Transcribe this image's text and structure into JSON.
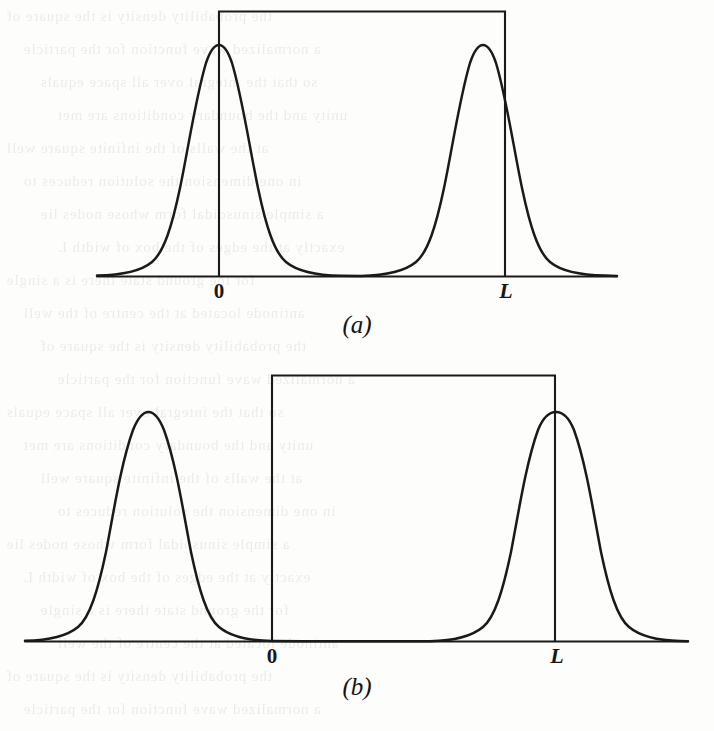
{
  "figure": {
    "background_color": "#fdfdfb",
    "ink_color": "#1a1a1a",
    "panels": [
      {
        "id": "a",
        "caption": "(a)",
        "tick_zero": "0",
        "tick_L": "L"
      },
      {
        "id": "b",
        "caption": "(b)",
        "tick_zero": "0",
        "tick_L": "L"
      }
    ]
  },
  "bleed_text": {
    "lines": [
      "the probability density is the square of",
      "a normalized wave function for the particle",
      "so that the integral over all space equals",
      "unity and the boundary conditions are met",
      "at the walls of the infinite square well",
      "in one dimension the solution reduces to",
      "a simple sinusoidal form whose nodes lie",
      "exactly at the edges of the box of width L",
      "for the ground state there is a single",
      "antinode located at the centre of the well"
    ]
  },
  "chart_data": [
    {
      "type": "line",
      "title": "(a)",
      "xlabel": "",
      "ylabel": "",
      "annotations": [
        "0",
        "L"
      ],
      "grid": false,
      "legend": null,
      "xlim": [
        -1.62,
        2.62
      ],
      "ylim": [
        0,
        1.15
      ],
      "x_tick_values": [
        0,
        1
      ],
      "x_tick_labels": [
        "0",
        "L"
      ],
      "description": "Two identical Gaussian wave packets peaked at x = 0 and x = L, drawn on a horizontal baseline, with a rectangular box (potential well) of height 1.13 spanning from 0 to L. Vertical lines drop from the box top down to the baseline at x = 0 and x = L.",
      "series": [
        {
          "name": "probability-density",
          "kind": "double-gaussian",
          "peak_centers": [
            0,
            1
          ],
          "peak_height": 0.87,
          "peak_sigma": 0.135,
          "baseline": 0
        },
        {
          "name": "potential-well-box",
          "kind": "rectangle-top",
          "x_start": 0,
          "x_end": 1,
          "height": 1.13
        }
      ]
    },
    {
      "type": "line",
      "title": "(b)",
      "xlabel": "",
      "ylabel": "",
      "annotations": [
        "0",
        "L"
      ],
      "grid": false,
      "legend": null,
      "xlim": [
        -0.87,
        1.47
      ],
      "ylim": [
        0,
        1.12
      ],
      "x_tick_values": [
        0,
        1
      ],
      "x_tick_labels": [
        "0",
        "L"
      ],
      "description": "Two Gaussian wave packets, one peaked outside the well at x = -0.44 and one peaked at the right wall x = L, on a horizontal baseline. A rectangular box spans 0 to L with height 1.09. Vertical lines drop from the box top to the baseline at x = 0 and at x = L.",
      "series": [
        {
          "name": "probability-density",
          "kind": "double-gaussian",
          "peak_centers": [
            -0.435,
            1.003
          ],
          "peak_height": 0.81,
          "peak_sigma": 0.126,
          "baseline": 0
        },
        {
          "name": "potential-well-box",
          "kind": "rectangle-top",
          "x_start": 0,
          "x_end": 1,
          "height": 1.09
        }
      ]
    }
  ]
}
